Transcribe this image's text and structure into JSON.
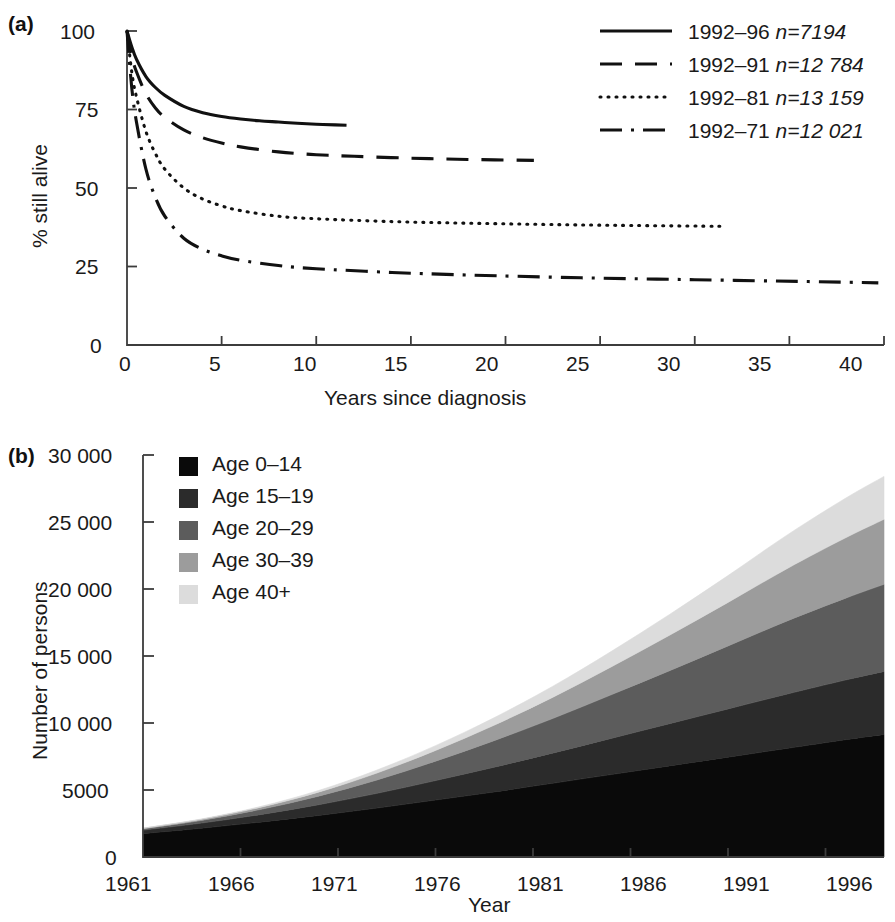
{
  "figure": {
    "panel_a_label": "(a)",
    "panel_b_label": "(b)"
  },
  "chart_data": [
    {
      "type": "line",
      "panel": "(a)",
      "title": "",
      "xlabel": "Years since diagnosis",
      "ylabel": "% still alive",
      "xlim": [
        0,
        40
      ],
      "ylim": [
        0,
        100
      ],
      "xticks": [
        "0",
        "5",
        "10",
        "15",
        "20",
        "25",
        "30",
        "35",
        "40"
      ],
      "xtick_values": [
        0,
        5,
        10,
        15,
        20,
        25,
        30,
        35,
        40
      ],
      "yticks": [
        "0",
        "25",
        "50",
        "75",
        "100"
      ],
      "ytick_values": [
        0,
        25,
        50,
        75,
        100
      ],
      "grid": false,
      "legend_position": "top-right",
      "series": [
        {
          "name": "1992–96",
          "label": "1992–96 n=7194",
          "cohort": "1992–96",
          "n_label": "n=7194",
          "n": 7194,
          "dash": "solid",
          "x": [
            0,
            0.25,
            0.5,
            1,
            1.5,
            2,
            3,
            4,
            5,
            6,
            7,
            8,
            9,
            10,
            11,
            11.6
          ],
          "y": [
            100,
            95,
            91,
            85.5,
            82,
            79.5,
            76,
            74,
            72.8,
            72,
            71.4,
            71,
            70.6,
            70.3,
            70.1,
            70
          ]
        },
        {
          "name": "1992–91",
          "label": "1992–91 n=12 784",
          "cohort": "1992–91",
          "n_label": "n=12 784",
          "n": 12784,
          "dash": "dashed",
          "x": [
            0,
            0.25,
            0.5,
            1,
            1.5,
            2,
            3,
            4,
            5,
            6,
            8,
            10,
            12,
            15,
            18,
            21.5
          ],
          "y": [
            100,
            92,
            87,
            80,
            75.5,
            72.5,
            68.5,
            66,
            64.3,
            63.1,
            61.5,
            60.6,
            60.1,
            59.5,
            59.1,
            58.8
          ]
        },
        {
          "name": "1992–81",
          "label": "1992–81 n=13 159",
          "cohort": "1992–81",
          "n_label": "n=13 159",
          "n": 13159,
          "dash": "dotted",
          "x": [
            0,
            0.25,
            0.5,
            1,
            1.5,
            2,
            3,
            4,
            5,
            6,
            8,
            10,
            14,
            18,
            22,
            26,
            31.5
          ],
          "y": [
            100,
            87,
            79,
            68,
            61,
            56,
            50,
            46.5,
            44.3,
            42.8,
            41,
            40.2,
            39.3,
            38.8,
            38.4,
            38.1,
            37.8
          ]
        },
        {
          "name": "1992–71",
          "label": "1992–71 n=12 021",
          "cohort": "1992–71",
          "n_label": "n=12 021",
          "n": 12021,
          "dash": "dashdot",
          "x": [
            0,
            0.25,
            0.5,
            1,
            1.5,
            2,
            3,
            4,
            5,
            6,
            8,
            10,
            14,
            18,
            24,
            30,
            36,
            39.7
          ],
          "y": [
            100,
            82,
            71,
            56,
            47,
            41,
            34,
            30.5,
            28.4,
            27,
            25.3,
            24.3,
            23.1,
            22.3,
            21.4,
            20.8,
            20.2,
            19.8
          ]
        }
      ]
    },
    {
      "type": "area",
      "panel": "(b)",
      "stacked": true,
      "title": "",
      "xlabel": "Year",
      "ylabel": "Number of persons",
      "xlim": [
        1961,
        1999
      ],
      "ylim": [
        0,
        30000
      ],
      "xticks": [
        "1961",
        "1966",
        "1971",
        "1976",
        "1981",
        "1986",
        "1991",
        "1996"
      ],
      "xtick_values": [
        1961,
        1966,
        1971,
        1976,
        1981,
        1986,
        1991,
        1996
      ],
      "yticks": [
        "0",
        "5000",
        "10 000",
        "15 000",
        "20 000",
        "25 000",
        "30 000"
      ],
      "ytick_values": [
        0,
        5000,
        10000,
        15000,
        20000,
        25000,
        30000
      ],
      "grid": false,
      "legend_position": "top-left",
      "x": [
        1961,
        1964,
        1967,
        1970,
        1973,
        1976,
        1979,
        1982,
        1985,
        1988,
        1991,
        1994,
        1997,
        1999
      ],
      "series": [
        {
          "name": "Age 0–14",
          "label": "Age 0–14",
          "color": "#0a0a0a",
          "values": [
            1750,
            2150,
            2600,
            3100,
            3650,
            4250,
            4850,
            5500,
            6150,
            6800,
            7450,
            8100,
            8750,
            9150
          ]
        },
        {
          "name": "Age 15–19",
          "label": "Age 15–19",
          "color": "#2b2b2b",
          "values": [
            250,
            380,
            560,
            800,
            1100,
            1450,
            1850,
            2250,
            2700,
            3150,
            3600,
            4050,
            4450,
            4700
          ]
        },
        {
          "name": "Age 20–29",
          "label": "Age 20–29",
          "color": "#5c5c5c",
          "values": [
            100,
            200,
            380,
            640,
            1000,
            1450,
            1980,
            2580,
            3250,
            3950,
            4700,
            5450,
            6100,
            6500
          ]
        },
        {
          "name": "Age 30–39",
          "label": "Age 30–39",
          "color": "#9c9c9c",
          "values": [
            40,
            80,
            160,
            300,
            520,
            800,
            1150,
            1580,
            2080,
            2650,
            3250,
            3900,
            4500,
            4850
          ]
        },
        {
          "name": "Age 40+",
          "label": "Age 40+",
          "color": "#dcdcdc",
          "values": [
            15,
            30,
            60,
            120,
            220,
            360,
            560,
            820,
            1150,
            1550,
            2000,
            2500,
            2950,
            3200
          ]
        }
      ]
    }
  ]
}
